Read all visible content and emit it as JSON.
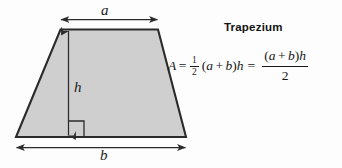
{
  "figure": {
    "title": "Trapezium",
    "shape": {
      "name": "trapezium",
      "fill_color": "#cfcfcf",
      "stroke_color": "#2b2b2b",
      "top_edge_label": "a",
      "bottom_edge_label": "b",
      "height_label": "h",
      "right_angle_marker": true
    },
    "labels": {
      "a": "a",
      "b": "b",
      "h": "h"
    },
    "formula": {
      "lhs_variable": "A",
      "equals": "=",
      "half_numerator": "1",
      "half_denominator": "2",
      "open_paren": "(",
      "a": "a",
      "plus": "+",
      "b": "b",
      "close_paren": ")",
      "h": "h",
      "second_equals": "=",
      "fraction_numerator_open": "(",
      "fraction_numerator_a": "a",
      "fraction_numerator_plus": "+",
      "fraction_numerator_b": "b",
      "fraction_numerator_close": ")",
      "fraction_numerator_h": "h",
      "fraction_denominator": "2",
      "plain_text": "A = 1/2 (a + b)h = (a + b)h / 2"
    }
  },
  "colors": {
    "background": "#fdfdfd",
    "shape_fill": "#cfcfcf",
    "shape_stroke": "#2b2b2b",
    "text": "#161616",
    "arrow": "#2b2b2b"
  }
}
